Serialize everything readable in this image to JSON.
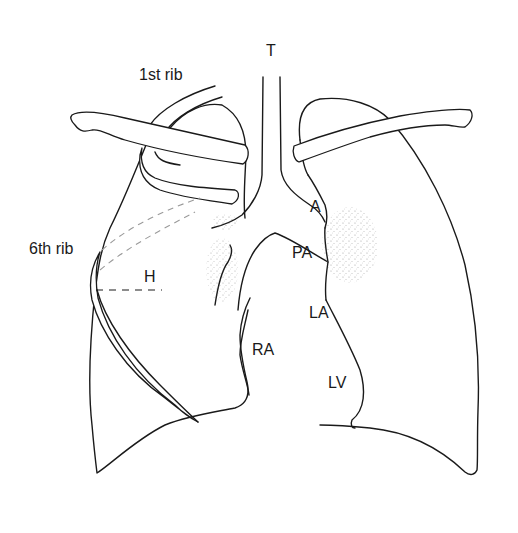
{
  "figure": {
    "type": "anatomical line drawing",
    "labels": {
      "trachea": "T",
      "first_rib": "1st rib",
      "sixth_rib": "6th rib",
      "horizontal_fissure": "H",
      "aorta": "A",
      "pulmonary_artery": "PA",
      "left_atrium": "LA",
      "right_atrium": "RA",
      "left_ventricle": "LV"
    },
    "colors": {
      "line": "#1a1a1a",
      "background": "#ffffff",
      "dashed_rib": "#9a9a9a"
    }
  }
}
